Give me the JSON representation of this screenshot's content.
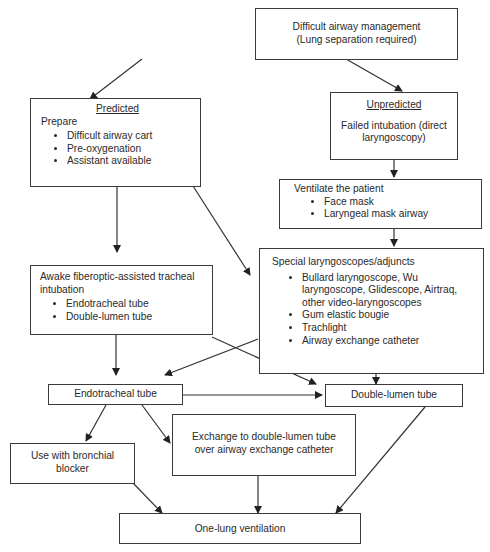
{
  "nodes": {
    "start": {
      "line1": "Difficult airway management",
      "line2": "(Lung separation required)"
    },
    "predicted": {
      "heading": "Predicted",
      "subheading": "Prepare",
      "items": [
        "Difficult airway cart",
        "Pre-oxygenation",
        "Assistant available"
      ]
    },
    "unpredicted": {
      "heading": "Unpredicted",
      "text": "Failed intubation (direct laryngoscopy)"
    },
    "ventilate": {
      "heading": "Ventilate the patient",
      "items": [
        "Face mask",
        "Laryngeal mask airway"
      ]
    },
    "special": {
      "heading": "Special laryngoscopes/adjuncts",
      "items": [
        "Bullard laryngoscope, Wu laryngoscope, Glidescope, Airtraq, other video-laryngoscopes",
        "Gum elastic bougie",
        "Trachlight",
        "Airway exchange catheter"
      ]
    },
    "awake": {
      "heading": "Awake fiberoptic-assisted tracheal intubation",
      "items": [
        "Endotracheal tube",
        "Double-lumen tube"
      ]
    },
    "ett": {
      "label": "Endotracheal tube"
    },
    "dlt": {
      "label": "Double-lumen tube"
    },
    "blocker": {
      "label": "Use with bronchial blocker"
    },
    "exchange": {
      "label": "Exchange to double-lumen tube over airway exchange catheter"
    },
    "olv": {
      "label": "One-lung ventilation"
    }
  },
  "edges": [
    [
      "start",
      "predicted"
    ],
    [
      "start",
      "unpredicted"
    ],
    [
      "unpredicted",
      "ventilate"
    ],
    [
      "ventilate",
      "special"
    ],
    [
      "predicted",
      "awake"
    ],
    [
      "predicted",
      "special"
    ],
    [
      "awake",
      "ett"
    ],
    [
      "awake",
      "dlt"
    ],
    [
      "special",
      "ett"
    ],
    [
      "special",
      "dlt"
    ],
    [
      "ett",
      "dlt"
    ],
    [
      "ett",
      "blocker"
    ],
    [
      "ett",
      "exchange"
    ],
    [
      "blocker",
      "olv"
    ],
    [
      "exchange",
      "olv"
    ],
    [
      "dlt",
      "olv"
    ]
  ]
}
